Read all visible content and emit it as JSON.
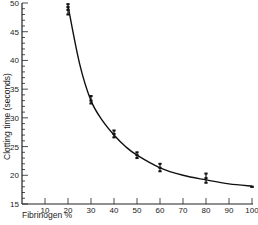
{
  "chart_data": {
    "type": "scatter",
    "title": "",
    "xlabel": "Fibrinogen %",
    "ylabel": "Clotting time (seconds)",
    "xlim": [
      0,
      100
    ],
    "ylim": [
      15,
      50
    ],
    "x_ticks": [
      10,
      20,
      30,
      40,
      50,
      60,
      70,
      80,
      90,
      100
    ],
    "y_ticks": [
      15,
      20,
      25,
      30,
      35,
      40,
      45,
      50
    ],
    "grid": false,
    "legend": null,
    "series": [
      {
        "name": "Measured clotting times",
        "marker": "dot",
        "points": [
          {
            "x": 20,
            "y": [
              48.0,
              48.8,
              49.3,
              49.8
            ]
          },
          {
            "x": 30,
            "y": [
              32.5,
              33.0,
              33.8
            ]
          },
          {
            "x": 40,
            "y": [
              26.6,
              27.2,
              27.8
            ]
          },
          {
            "x": 50,
            "y": [
              23.0,
              23.5,
              24.0
            ]
          },
          {
            "x": 60,
            "y": [
              20.7,
              21.3,
              22.0
            ]
          },
          {
            "x": 80,
            "y": [
              18.7,
              19.5,
              20.3
            ]
          },
          {
            "x": 100,
            "y": [
              18.0,
              18.0
            ]
          }
        ]
      },
      {
        "name": "Fitted curve",
        "type": "line",
        "x": [
          20,
          25,
          30,
          35,
          40,
          45,
          50,
          60,
          70,
          80,
          90,
          100
        ],
        "y": [
          49.5,
          39.5,
          33.0,
          29.5,
          27.0,
          25.0,
          23.5,
          21.3,
          20.0,
          19.2,
          18.5,
          18.1
        ]
      }
    ]
  }
}
